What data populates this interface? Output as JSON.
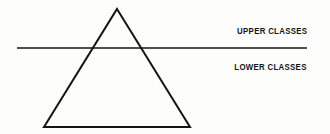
{
  "diagram": {
    "background_color": "#fdfdfc",
    "stroke_color": "#141414",
    "text_color": "#141414",
    "labels": {
      "upper": "UPPER CLASSES",
      "lower": "LOWER CLASSES"
    },
    "shapes": {
      "triangle": {
        "name": "class-pyramid",
        "apex": [
          117,
          9
        ],
        "bottom_left": [
          44,
          127
        ],
        "bottom_right": [
          190,
          127
        ],
        "stroke_width": 2,
        "fill": "none"
      },
      "divider_line": {
        "name": "class-divider",
        "x1": 17,
        "y1": 48,
        "x2": 307,
        "y2": 48,
        "stroke_width": 1.6
      }
    }
  }
}
